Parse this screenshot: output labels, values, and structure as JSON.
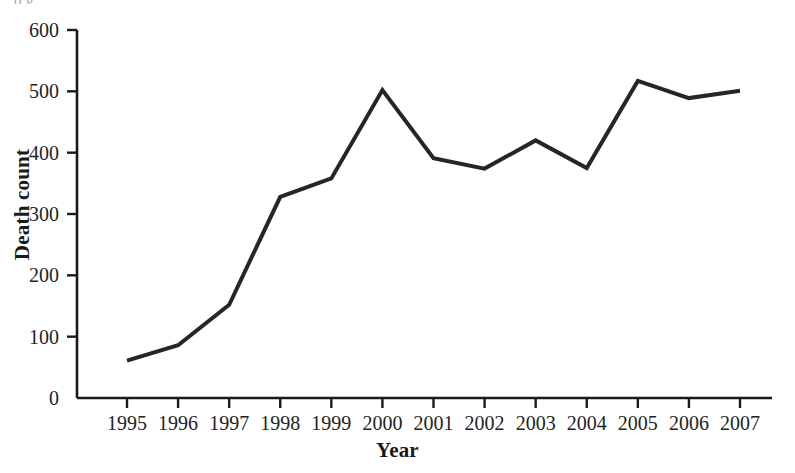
{
  "figure": {
    "clipped_header_text": "o                        g",
    "background_color": "#ffffff",
    "line_color": "#262626",
    "axis_color": "#1a1a1a"
  },
  "chart_data": {
    "type": "line",
    "title": "",
    "xlabel": "Year",
    "ylabel": "Death count",
    "categories": [
      "1995",
      "1996",
      "1997",
      "1998",
      "1999",
      "2000",
      "2001",
      "2002",
      "2003",
      "2004",
      "2005",
      "2006",
      "2007"
    ],
    "values": [
      61,
      86,
      152,
      328,
      358,
      502,
      391,
      374,
      420,
      375,
      517,
      489,
      501
    ],
    "series": [
      {
        "name": "Death count",
        "values": [
          61,
          86,
          152,
          328,
          358,
          502,
          391,
          374,
          420,
          375,
          517,
          489,
          501
        ]
      }
    ],
    "xlim": [
      "1995",
      "2007"
    ],
    "ylim": [
      0,
      600
    ],
    "ytick_labels": [
      "0",
      "100",
      "200",
      "300",
      "400",
      "500",
      "600"
    ],
    "ytick_values": [
      0,
      100,
      200,
      300,
      400,
      500,
      600
    ],
    "xtick_labels": [
      "1995",
      "1996",
      "1997",
      "1998",
      "1999",
      "2000",
      "2001",
      "2002",
      "2003",
      "2004",
      "2005",
      "2006",
      "2007"
    ],
    "grid": false,
    "legend": null,
    "markers": false,
    "line_width": 4
  }
}
